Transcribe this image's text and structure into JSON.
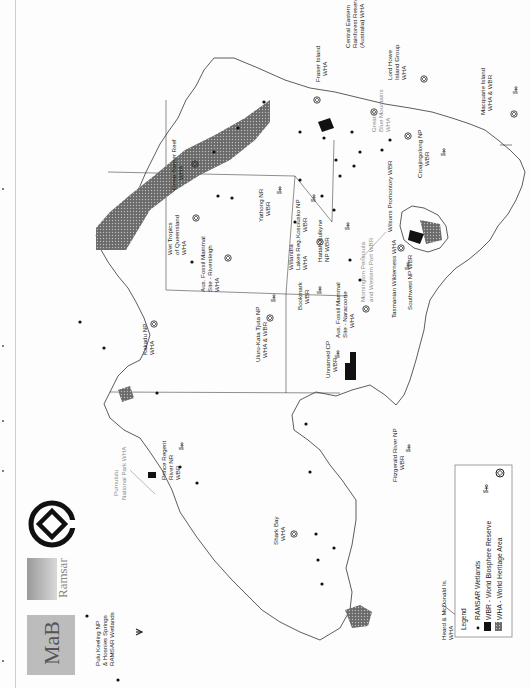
{
  "map": {
    "title": "Australia: RAMSAR Wetlands, World Biosphere Reserves and World Heritage Areas",
    "orientation": "rotated 90° counter-clockwise",
    "legend": {
      "title": "Legend",
      "items": [
        {
          "symbol": "dot",
          "label": "RAMSAR Wetlands"
        },
        {
          "symbol": "black-fill",
          "label": "WBR - World Biosphere Reserve",
          "icon": "mab-figure-icon"
        },
        {
          "symbol": "hatched-fill",
          "label": "WHA - World Heritage Area",
          "icon": "world-heritage-emblem-icon"
        }
      ]
    },
    "logos": [
      {
        "name": "MAB",
        "text": "MaB"
      },
      {
        "name": "Ramsar",
        "text": "Ramsar"
      },
      {
        "name": "World Heritage",
        "text": ""
      }
    ],
    "labels": {
      "great_barrier_reef": [
        "Great Barrier Reef",
        "WHA"
      ],
      "wet_tropics": [
        "Wet Tropics",
        "of Queensland",
        "WHA"
      ],
      "riversleigh": [
        "Aus. Fossil Mammal",
        "Site - Riversleigh",
        "WHA"
      ],
      "kakadu": [
        "Kakadu NP",
        "WHA"
      ],
      "uluru": [
        "Uluru-Kata Tjuta NP",
        "WHA & WBR"
      ],
      "unnamed_cp": [
        "Unnamed CP",
        "WBR"
      ],
      "fraser": [
        "Fraser Island",
        "WHA"
      ],
      "central_eastern": [
        "Central Eastern",
        "Rainforest Reserves",
        "(Australia) WHA"
      ],
      "lord_howe": [
        "Lord Howe",
        "Island Group",
        "WHA"
      ],
      "blue_mountains": [
        "Greater",
        "Blue Mountains",
        "WHA"
      ],
      "macquarie": [
        "Macquarie Island",
        "WHA & WBR"
      ],
      "croajingolong": [
        "Croajingolong NP",
        "WBR"
      ],
      "yathong": [
        "Yathong NR",
        "WBR"
      ],
      "kosciusko": [
        "Kosciusko NP",
        "WBR"
      ],
      "willandra": [
        "Willandra",
        "Lakes Reg.",
        "WHA"
      ],
      "hattah": [
        "Hattah-Kulkyne",
        "NP WBR"
      ],
      "wilsons": [
        "Wilsons Promontory WBR"
      ],
      "bookmark": [
        "Bookmark",
        "WBR"
      ],
      "naracoorte": [
        "Aus. Fossil Mammal",
        "Site - Naracoorte",
        "WHA"
      ],
      "mornington": [
        "Mornington Peninsula",
        "and Western Port WBR"
      ],
      "tasmanian": [
        "Tasmanian Wilderness WHA"
      ],
      "southwest": [
        "Southwest NP WBR"
      ],
      "purnululu": [
        "Purnululu",
        "National Park WHA"
      ],
      "prince_regent": [
        "Prince Regent",
        "River NR",
        "WBR"
      ],
      "fitzgerald": [
        "Fitzgerald River NP",
        "WBR"
      ],
      "shark_bay": [
        "Shark Bay",
        "WHA"
      ],
      "heard": [
        "Heard & McDonald Is.",
        "WHA"
      ],
      "pulu_keeling": [
        "Pulu Keeling NP",
        "& Hosnies Springs",
        "RAMSAR Wetlands"
      ]
    }
  }
}
